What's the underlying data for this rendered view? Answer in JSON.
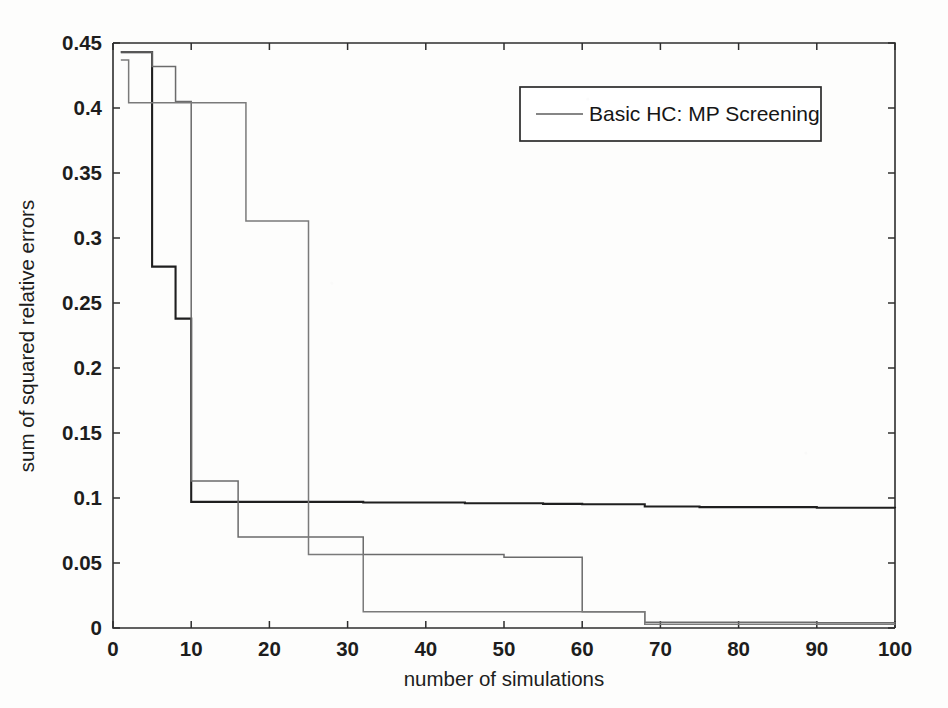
{
  "figure": {
    "background_color": "#fdfdfc",
    "axis_color": "#2e2e2e"
  },
  "chart_data": {
    "type": "line",
    "title": "",
    "xlabel": "number of simulations",
    "ylabel": "sum of squared relative errors",
    "xlim": [
      0,
      100
    ],
    "ylim": [
      0,
      0.45
    ],
    "xticks": [
      0,
      10,
      20,
      30,
      40,
      50,
      60,
      70,
      80,
      90,
      100
    ],
    "xtick_labels": [
      "0",
      "10",
      "20",
      "30",
      "40",
      "50",
      "60",
      "70",
      "80",
      "90",
      "100"
    ],
    "yticks": [
      0,
      0.05,
      0.1,
      0.15,
      0.2,
      0.25,
      0.3,
      0.35,
      0.4,
      0.45
    ],
    "ytick_labels": [
      "0",
      "0.05",
      "0.1",
      "0.15",
      "0.2",
      "0.25",
      "0.3",
      "0.35",
      "0.4",
      "0.45"
    ],
    "grid": false,
    "legend": {
      "position": "upper-right-inset",
      "entries": [
        {
          "label": "Basic HC: MP Screening",
          "color": "#5e5e5e"
        }
      ]
    },
    "series": [
      {
        "name": "run-1-dark",
        "color": "#1f1f1f",
        "width": 2.1,
        "step": "post",
        "x": [
          1,
          2,
          3,
          4,
          5,
          6,
          7,
          8,
          9,
          10,
          11,
          16,
          22,
          32,
          45,
          55,
          60,
          68,
          75,
          90,
          100
        ],
        "y": [
          0.443,
          0.443,
          0.443,
          0.443,
          0.278,
          0.278,
          0.278,
          0.238,
          0.238,
          0.097,
          0.097,
          0.097,
          0.097,
          0.0965,
          0.096,
          0.0955,
          0.0952,
          0.0935,
          0.093,
          0.0925,
          0.0922
        ]
      },
      {
        "name": "run-2-mid",
        "color": "#6b6b6b",
        "width": 1.5,
        "step": "post",
        "x": [
          1,
          2,
          4,
          5,
          7,
          8,
          9,
          10,
          11,
          15,
          16,
          17,
          22,
          26,
          32,
          40,
          50,
          54,
          60,
          66,
          68,
          80,
          90,
          100
        ],
        "y": [
          0.443,
          0.443,
          0.443,
          0.432,
          0.432,
          0.405,
          0.405,
          0.113,
          0.113,
          0.113,
          0.07,
          0.07,
          0.07,
          0.07,
          0.0565,
          0.0565,
          0.0545,
          0.0545,
          0.0125,
          0.0125,
          0.0045,
          0.0045,
          0.004,
          0.0038
        ]
      },
      {
        "name": "run-3-light",
        "color": "#7a7a7a",
        "width": 1.5,
        "step": "post",
        "x": [
          1,
          2,
          3,
          5,
          6,
          7,
          8,
          11,
          12,
          15,
          16,
          17,
          22,
          25,
          26,
          31,
          32,
          45,
          55,
          65,
          68,
          80,
          90,
          100
        ],
        "y": [
          0.437,
          0.404,
          0.404,
          0.404,
          0.404,
          0.404,
          0.404,
          0.404,
          0.404,
          0.404,
          0.404,
          0.313,
          0.313,
          0.0565,
          0.0565,
          0.0565,
          0.0125,
          0.0125,
          0.0125,
          0.0125,
          0.0028,
          0.0028,
          0.0028,
          0.0025
        ]
      }
    ]
  }
}
